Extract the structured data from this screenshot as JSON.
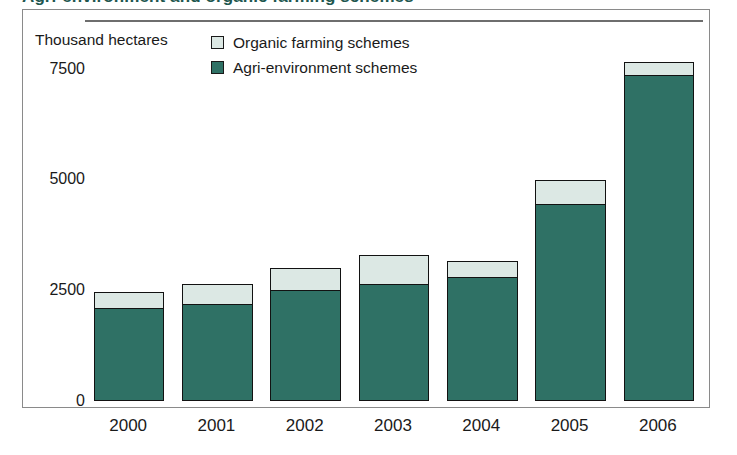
{
  "title": {
    "text": "Agri-environment and organic farming schemes"
  },
  "legend": {
    "position": "top-center",
    "items": [
      {
        "label": "Organic farming schemes",
        "color": "#dce8e4",
        "icon": "legend-swatch-organic"
      },
      {
        "label": "Agri-environment schemes",
        "color": "#2f7165",
        "icon": "legend-swatch-agri"
      }
    ]
  },
  "axes": {
    "y_unit_caption": "Thousand hectares",
    "y_ticks": [
      "0",
      "2500",
      "5000",
      "7500"
    ],
    "x_ticks": [
      "2000",
      "2001",
      "2002",
      "2003",
      "2004",
      "2005",
      "2006"
    ]
  },
  "chart_data": {
    "type": "bar",
    "subtype": "stacked",
    "title": "Agri-environment and organic farming schemes",
    "xlabel": "",
    "ylabel": "Thousand hectares",
    "ylim": [
      0,
      8600
    ],
    "yticks": [
      0,
      2500,
      5000,
      7500
    ],
    "grid": false,
    "legend_position": "top-center",
    "categories": [
      "2000",
      "2001",
      "2002",
      "2003",
      "2004",
      "2005",
      "2006"
    ],
    "series": [
      {
        "name": "Agri-environment schemes",
        "color": "#2f7165",
        "values": [
          2100,
          2200,
          2500,
          2650,
          2800,
          4450,
          7350
        ]
      },
      {
        "name": "Organic farming schemes",
        "color": "#dce8e4",
        "values": [
          350,
          450,
          500,
          650,
          350,
          550,
          300
        ]
      }
    ],
    "totals": [
      2450,
      2650,
      3000,
      3300,
      3150,
      5000,
      7650
    ]
  },
  "style": {
    "frame_border": "#8a8a8a",
    "axis_line": "#6e6e6e",
    "bar_outline": "#121212",
    "text": "#1a1a1a",
    "title_color": "#20564e",
    "background": "#ffffff"
  }
}
